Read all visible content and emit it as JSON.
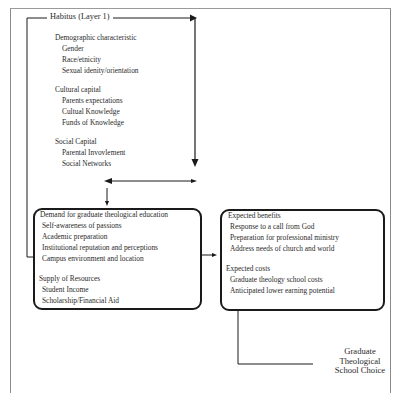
{
  "diagram": {
    "title": "Habitus (Layer 1)",
    "habitus": {
      "groups": [
        {
          "heading": "Demographic characteristic",
          "items": [
            "Gender",
            "Race/etnicity",
            "Sexual idenity/orientation"
          ]
        },
        {
          "heading": "Cultural capital",
          "items": [
            "Parents expectations",
            "Cultual Knowledge",
            "Funds of Knowledge"
          ]
        },
        {
          "heading": "Social Capital",
          "items": [
            "Parental Invovlement",
            "Social Networks"
          ]
        }
      ]
    },
    "demand_box": {
      "heading": "Demand for graduate theological education",
      "items": [
        "Self-awareness of passions",
        "Academic preparation",
        "Institutional reputation and perceptions",
        "Campus environment and location"
      ],
      "supply_heading": "Supply of Resources",
      "supply_items": [
        "Student Income",
        "Scholarship/Financial Aid"
      ]
    },
    "benefits_box": {
      "benefits_heading": "Expected benefits",
      "benefits_items": [
        "Response to a call from God",
        "Preparation for professional ministry",
        "Address needs of church and world"
      ],
      "costs_heading": "Expected costs",
      "costs_items": [
        "Graduate theology school costs",
        "Anticipated lower earning potential"
      ]
    },
    "outcome": {
      "line1": "Graduate",
      "line2": "Theological",
      "line3": "School Choice"
    },
    "colors": {
      "line": "#1a1a1a",
      "frame": "#8a8a8a",
      "text": "#2a2a2a"
    }
  }
}
